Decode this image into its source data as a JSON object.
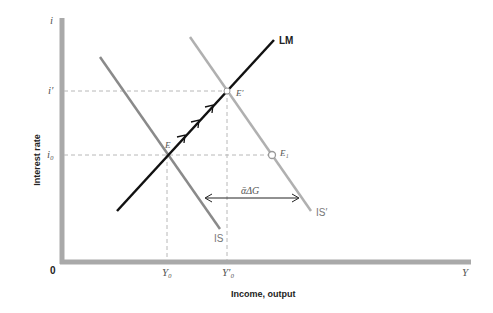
{
  "diagram": {
    "y_axis": {
      "symbol": "i",
      "label": "Interest rate",
      "ticks": [
        {
          "label": "i′",
          "y": 91
        },
        {
          "label": "i₀",
          "y": 155
        }
      ]
    },
    "x_axis": {
      "symbol": "Y",
      "label": "Income, output",
      "origin": "0",
      "ticks": [
        {
          "label": "Y₀",
          "x": 167
        },
        {
          "label": "Y′₀",
          "x": 227
        }
      ]
    },
    "curves": {
      "lm": {
        "label": "LM",
        "color": "#111111"
      },
      "is": {
        "label": "IS",
        "color": "#8a8a8a"
      },
      "is_prime": {
        "label": "IS′",
        "color": "#b0b0b0"
      }
    },
    "points": {
      "e": {
        "label": "E"
      },
      "e_prime": {
        "label": "E′"
      },
      "e1": {
        "label": "E₁"
      }
    },
    "shift_annotation": "ᾱΔG",
    "axis_color": "#a9a9a9"
  }
}
